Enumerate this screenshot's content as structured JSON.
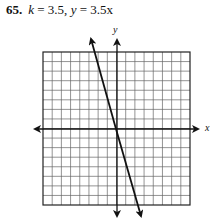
{
  "problem": {
    "number": "65.",
    "k_label": "k",
    "k_value": "= 3.5,",
    "eq_label": "y",
    "eq_rhs": "= 3.5x"
  },
  "chart_data": {
    "type": "line",
    "xlabel": "x",
    "ylabel": "y",
    "grid": true,
    "grid_squares": 16,
    "xlim": [
      -8,
      8
    ],
    "ylim": [
      -8,
      8
    ],
    "series": [
      {
        "name": "drawn line (passes through origin, steep negative slope as drawn)",
        "x": [
          -2.8,
          2.6
        ],
        "y": [
          9.8,
          -9.4
        ],
        "slope_as_drawn": -3.5
      }
    ],
    "annotations": [
      "Line with arrows at both ends",
      "Axes with arrows at both ends"
    ]
  },
  "colors": {
    "ink": "#111111",
    "grid": "#555555"
  }
}
